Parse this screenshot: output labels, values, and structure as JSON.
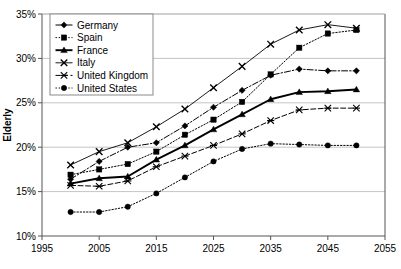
{
  "chart_data": {
    "type": "line",
    "title": "",
    "xlabel": "",
    "ylabel": "Elderly",
    "xlim": [
      1995,
      2055
    ],
    "ylim": [
      10,
      35
    ],
    "xticks": [
      1995,
      2005,
      2015,
      2025,
      2035,
      2045,
      2055
    ],
    "yticks": [
      10,
      15,
      20,
      25,
      30,
      35
    ],
    "ytick_labels": [
      "10%",
      "15%",
      "20%",
      "25%",
      "30%",
      "35%"
    ],
    "xtick_labels": [
      "1995",
      "2005",
      "2015",
      "2025",
      "2035",
      "2045",
      "2055"
    ],
    "grid": true,
    "legend_position": "top-left",
    "x": [
      2000,
      2005,
      2010,
      2015,
      2020,
      2025,
      2030,
      2035,
      2040,
      2045,
      2050
    ],
    "series": [
      {
        "name": "Germany",
        "marker": "diamond",
        "dash": "dashdot",
        "values": [
          16.4,
          18.4,
          20.0,
          20.5,
          22.4,
          24.5,
          26.4,
          28.1,
          28.8,
          28.6,
          28.6
        ]
      },
      {
        "name": "Spain",
        "marker": "square",
        "dash": "dotted",
        "values": [
          16.9,
          17.5,
          18.1,
          19.5,
          21.4,
          23.1,
          25.1,
          28.2,
          31.2,
          32.8,
          33.2
        ]
      },
      {
        "name": "France",
        "marker": "triangle",
        "dash": "solid",
        "values": [
          15.9,
          16.5,
          16.7,
          18.6,
          20.2,
          22.0,
          23.7,
          25.4,
          26.2,
          26.3,
          26.5
        ]
      },
      {
        "name": "Italy",
        "marker": "x",
        "dash": "solid-thin",
        "values": [
          18.0,
          19.5,
          20.5,
          22.3,
          24.3,
          26.7,
          29.1,
          31.6,
          33.2,
          33.8,
          33.4
        ]
      },
      {
        "name": "United Kingdom",
        "marker": "asterisk",
        "dash": "dashed",
        "values": [
          15.7,
          15.6,
          16.2,
          17.8,
          19.0,
          20.2,
          21.5,
          23.0,
          24.2,
          24.4,
          24.4
        ]
      },
      {
        "name": "United States",
        "marker": "circle",
        "dash": "dotted",
        "values": [
          12.7,
          12.7,
          13.3,
          14.8,
          16.6,
          18.4,
          19.8,
          20.4,
          20.3,
          20.2,
          20.2
        ]
      }
    ]
  },
  "legend": {
    "items": [
      {
        "label": "Germany"
      },
      {
        "label": "Spain"
      },
      {
        "label": "France"
      },
      {
        "label": "Italy"
      },
      {
        "label": "United Kingdom"
      },
      {
        "label": "United States"
      }
    ]
  },
  "axis": {
    "y_title": "Elderly"
  }
}
